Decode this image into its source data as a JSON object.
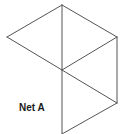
{
  "diagram": {
    "label": "Net A",
    "stroke_color": "#555555",
    "vertices": {
      "top": [
        62,
        5
      ],
      "left": [
        7,
        37
      ],
      "right": [
        117,
        37
      ],
      "center": [
        62,
        70
      ],
      "lower_right": [
        117,
        103
      ],
      "bottom": [
        62,
        134
      ]
    },
    "edges": [
      [
        "top",
        "left"
      ],
      [
        "left",
        "center"
      ],
      [
        "top",
        "center"
      ],
      [
        "top",
        "right"
      ],
      [
        "right",
        "center"
      ],
      [
        "right",
        "lower_right"
      ],
      [
        "center",
        "lower_right"
      ],
      [
        "center",
        "bottom"
      ],
      [
        "bottom",
        "lower_right"
      ]
    ],
    "triangles": 4
  }
}
